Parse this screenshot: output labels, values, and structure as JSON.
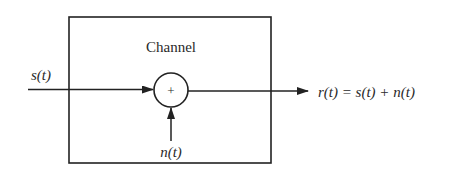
{
  "diagram": {
    "block_label": "Channel",
    "adder_symbol": "+",
    "input_label": "s(t)",
    "noise_label": "n(t)",
    "output_label": "r(t) = s(t) + n(t)",
    "colors": {
      "stroke": "#222222",
      "text": "#2a2a2a",
      "background": "#ffffff"
    }
  }
}
